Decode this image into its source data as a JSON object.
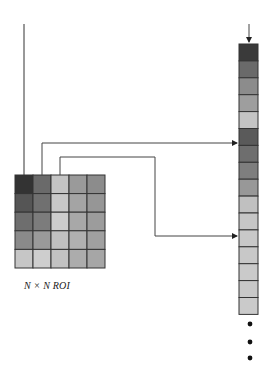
{
  "roi": {
    "label": "N × N ROI",
    "rows": 5,
    "cols": 5,
    "cells": [
      [
        "#333333",
        "#6a6a6a",
        "#c4c4c4",
        "#9a9a9a",
        "#8c8c8c"
      ],
      [
        "#555555",
        "#707070",
        "#c8c8c8",
        "#a4a4a4",
        "#969696"
      ],
      [
        "#6e6e6e",
        "#7c7c7c",
        "#cccccc",
        "#a8a8a8",
        "#9c9c9c"
      ],
      [
        "#8a8a8a",
        "#9a9a9a",
        "#c0c0c0",
        "#b0b0b0",
        "#a0a0a0"
      ],
      [
        "#c6c6c6",
        "#cecece",
        "#c2c2c2",
        "#acacac",
        "#a6a6a6"
      ]
    ]
  },
  "vector": {
    "cells": [
      "#3a3a3a",
      "#6a6a6a",
      "#8c8c8c",
      "#9e9e9e",
      "#c4c4c4",
      "#5a5a5a",
      "#6e6e6e",
      "#7e7e7e",
      "#989898",
      "#c0c0c0",
      "#c6c6c6",
      "#c8c8c8",
      "#c8c8c8",
      "#cacaca",
      "#c8c8c8",
      "#cacaca"
    ],
    "continuation": "⋮"
  }
}
